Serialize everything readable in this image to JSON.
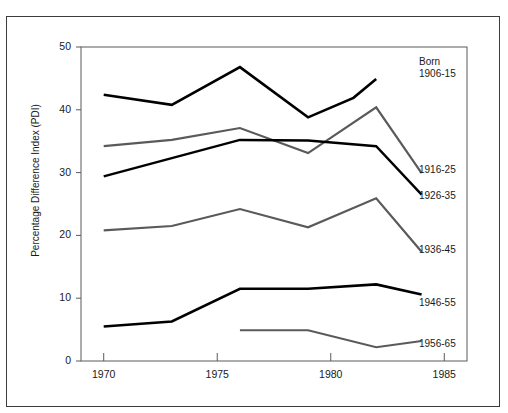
{
  "page": {
    "top_cut_text": ""
  },
  "chart_data": {
    "type": "line",
    "title": "",
    "xlabel": "",
    "ylabel": "Percentage Difference Index (PDI)",
    "xlim": [
      1969,
      1986
    ],
    "ylim": [
      0,
      50
    ],
    "xticks": [
      1970,
      1975,
      1980,
      1985
    ],
    "xtick_labels": [
      "1970",
      "1975",
      "1980",
      "1985"
    ],
    "yticks": [
      0,
      10,
      20,
      30,
      40,
      50
    ],
    "ytick_labels": [
      "0",
      "10",
      "20",
      "30",
      "40",
      "50"
    ],
    "grid": false,
    "legend_position": "right-inline",
    "legend_header": "Born",
    "series": [
      {
        "name": "1906-15",
        "color": "#000000",
        "width": 2.6,
        "label": "1906-15",
        "x": [
          1970,
          1973,
          1976,
          1979,
          1981,
          1982
        ],
        "values": [
          42.4,
          40.8,
          46.8,
          38.8,
          41.9,
          44.9
        ]
      },
      {
        "name": "1916-25",
        "color": "#5a5a5a",
        "width": 2.2,
        "label": "1916-25",
        "x": [
          1970,
          1973,
          1976,
          1979,
          1982,
          1984
        ],
        "values": [
          34.2,
          35.2,
          37.1,
          33.1,
          40.4,
          29.9
        ]
      },
      {
        "name": "1926-35",
        "color": "#000000",
        "width": 2.4,
        "label": "1926-35",
        "x": [
          1970,
          1973,
          1976,
          1979,
          1982,
          1984
        ],
        "values": [
          29.4,
          32.3,
          35.2,
          35.1,
          34.2,
          26.5
        ]
      },
      {
        "name": "1936-45",
        "color": "#5a5a5a",
        "width": 2.2,
        "label": "1936-45",
        "x": [
          1970,
          1973,
          1976,
          1979,
          1982,
          1984
        ],
        "values": [
          20.8,
          21.5,
          24.2,
          21.3,
          25.9,
          17.4
        ]
      },
      {
        "name": "1946-55",
        "color": "#000000",
        "width": 2.6,
        "label": "1946-55",
        "x": [
          1970,
          1973,
          1976,
          1979,
          1982,
          1984
        ],
        "values": [
          5.5,
          6.3,
          11.5,
          11.5,
          12.2,
          10.6
        ]
      },
      {
        "name": "1956-65",
        "color": "#5a5a5a",
        "width": 2.0,
        "label": "1956-65",
        "x": [
          1976,
          1979,
          1982,
          1984
        ],
        "values": [
          4.9,
          4.9,
          2.2,
          3.2
        ]
      }
    ]
  },
  "labels": {
    "born_header": "Born",
    "s1": "1906-15",
    "s2": "1916-25",
    "s3": "1926-35",
    "s4": "1936-45",
    "s5": "1946-55",
    "s6": "1956-65"
  },
  "colors": {
    "axis": "#5a5a5a",
    "frame": "#3c3c3c",
    "dark_series": "#000000",
    "gray_series": "#5a5a5a",
    "text": "#1a1a1a"
  }
}
